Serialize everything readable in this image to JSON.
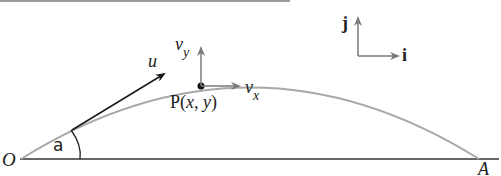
{
  "diagram": {
    "type": "projectile-motion",
    "labels": {
      "origin": "O",
      "landing": "A",
      "angle": "a",
      "velocity": "u",
      "point": "P(",
      "point_x": "x",
      "point_sep": ", ",
      "point_y": "y",
      "point_close": ")",
      "vy_base": "v",
      "vy_sub": "y",
      "vx_base": "v",
      "vx_sub": "x",
      "unit_j": "j",
      "unit_i": "i"
    },
    "colors": {
      "trajectory": "#a8a8a8",
      "ground": "#333333",
      "velocity_arrow": "#1a1a1a",
      "component_arrows": "#7a7a7a",
      "point": "#111111"
    }
  }
}
